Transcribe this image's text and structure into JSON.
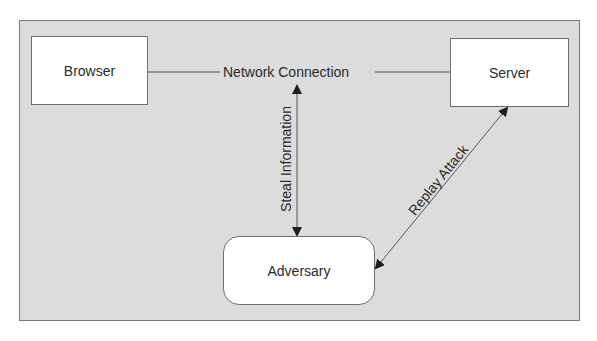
{
  "diagram": {
    "type": "network-attack-diagram",
    "nodes": [
      {
        "id": "browser",
        "label": "Browser",
        "shape": "rectangle"
      },
      {
        "id": "server",
        "label": "Server",
        "shape": "rectangle"
      },
      {
        "id": "adversary",
        "label": "Adversary",
        "shape": "rounded-rectangle"
      }
    ],
    "edges": [
      {
        "from": "browser",
        "to": "server",
        "label": "Network Connection",
        "style": "line",
        "arrows": "none"
      },
      {
        "from": "network-connection",
        "to": "adversary",
        "label": "Steal Information",
        "style": "line",
        "arrows": "both"
      },
      {
        "from": "adversary",
        "to": "server",
        "label": "Replay Attack",
        "style": "line",
        "arrows": "both"
      }
    ]
  },
  "colors": {
    "panel_background": "#dcdcdc",
    "panel_border": "#7a7a7a",
    "node_fill": "#ffffff",
    "node_border": "#6e6e6e",
    "line": "#555555",
    "arrowhead": "#1e1e1e",
    "text": "#2a2a2a"
  }
}
